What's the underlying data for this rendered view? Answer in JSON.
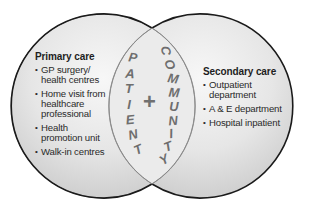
{
  "diagram": {
    "type": "venn",
    "left_circle": {
      "title": "Primary care",
      "items": [
        "GP surgery/ health centres",
        "Home visit from healthcare professional",
        "Health promotion unit",
        "Walk-in centres"
      ]
    },
    "right_circle": {
      "title": "Secondary care",
      "items": [
        "Outpatient department",
        "A & E department",
        "Hospital inpatient"
      ]
    },
    "overlap": {
      "left_word": "PATIENT",
      "left_letters": [
        "P",
        "A",
        "T",
        "I",
        "E",
        "N",
        "T"
      ],
      "symbol": "+",
      "right_word": "COMMUNITY",
      "right_letters": [
        "C",
        "O",
        "M",
        "M",
        "U",
        "N",
        "I",
        "T",
        "Y"
      ]
    },
    "colors": {
      "circle_fill_light": "#f6f6f6",
      "circle_fill_dark": "#d2d2d2",
      "outline": "#1a1a1a",
      "lens_outline": "#8a8a8a",
      "overlap_text": "#6e6e6e"
    }
  }
}
